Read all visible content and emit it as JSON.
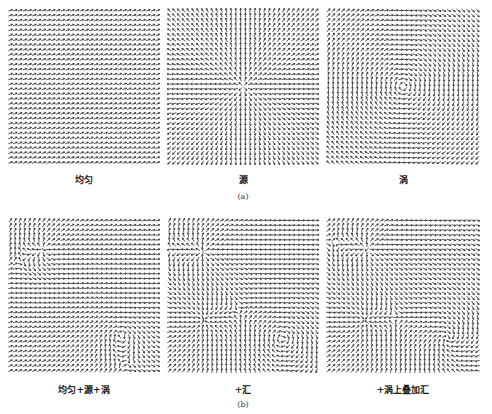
{
  "figure": {
    "rows": [
      {
        "sublabel": "(a)",
        "panels": [
          {
            "id": "uniform",
            "label": "均匀",
            "components": [
              {
                "type": "uniform",
                "angle_deg": -20,
                "strength": 1
              }
            ]
          },
          {
            "id": "source",
            "label": "源",
            "components": [
              {
                "type": "source",
                "x": 0.5,
                "y": 0.5,
                "strength": 1
              }
            ]
          },
          {
            "id": "vortex",
            "label": "涡",
            "components": [
              {
                "type": "vortex",
                "x": 0.5,
                "y": 0.5,
                "strength": 1
              }
            ]
          }
        ]
      },
      {
        "sublabel": "(b)",
        "panels": [
          {
            "id": "uniform-source-vortex",
            "label": "均匀+源+涡",
            "components": [
              {
                "type": "uniform",
                "angle_deg": -20,
                "strength": 0.6
              },
              {
                "type": "source",
                "x": 0.23,
                "y": 0.2,
                "strength": 1
              },
              {
                "type": "vortex",
                "x": 0.74,
                "y": 0.76,
                "strength": 1
              }
            ]
          },
          {
            "id": "plus-sink",
            "label": "+汇",
            "components": [
              {
                "type": "uniform",
                "angle_deg": -20,
                "strength": 0.3
              },
              {
                "type": "source",
                "x": 0.24,
                "y": 0.22,
                "strength": 1
              },
              {
                "type": "sink",
                "x": 0.24,
                "y": 0.66,
                "strength": 1.2
              },
              {
                "type": "vortex",
                "x": 0.76,
                "y": 0.78,
                "strength": 1
              }
            ]
          },
          {
            "id": "vortex-plus-sink",
            "label": "+涡上叠加汇",
            "components": [
              {
                "type": "uniform",
                "angle_deg": -20,
                "strength": 0.3
              },
              {
                "type": "source",
                "x": 0.27,
                "y": 0.2,
                "strength": 1
              },
              {
                "type": "sink",
                "x": 0.25,
                "y": 0.66,
                "strength": 1.2
              },
              {
                "type": "vortex",
                "x": 0.79,
                "y": 0.78,
                "strength": 1
              },
              {
                "type": "sink",
                "x": 0.79,
                "y": 0.78,
                "strength": 0.8
              }
            ]
          }
        ]
      }
    ],
    "colors": {
      "arrow": "#2b2b2b",
      "background": "#ffffff"
    },
    "grid": {
      "cols": 32,
      "rows": 32
    }
  }
}
